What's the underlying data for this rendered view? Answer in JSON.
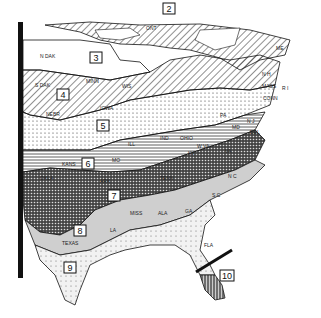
{
  "map": {
    "type": "hardiness-zone-map",
    "region": "Eastern United States",
    "zones": [
      {
        "id": "2",
        "label": "2",
        "pattern": "diagonal-hatch"
      },
      {
        "id": "3",
        "label": "3",
        "pattern": "white"
      },
      {
        "id": "4",
        "label": "4",
        "pattern": "diagonal-hatch"
      },
      {
        "id": "5",
        "label": "5",
        "pattern": "dots"
      },
      {
        "id": "6",
        "label": "6",
        "pattern": "horizontal-lines"
      },
      {
        "id": "7",
        "label": "7",
        "pattern": "cross-hatch-dark"
      },
      {
        "id": "8",
        "label": "8",
        "pattern": "light-gray"
      },
      {
        "id": "9",
        "label": "9",
        "pattern": "sparse-dots"
      },
      {
        "id": "10",
        "label": "10",
        "pattern": "vertical-stripes"
      }
    ],
    "states": {
      "ndak": "N DAK",
      "sdak": "S DAK",
      "minn": "MINN",
      "wis": "WIS",
      "nebr": "NEBR",
      "iowa": "IOWA",
      "kans": "KANS",
      "mo": "MO",
      "ill": "ILL",
      "ind": "IND",
      "ohio": "OHIO",
      "ky": "KY",
      "okla": "OKLA",
      "ark": "ARK",
      "tenn": "TENN",
      "texas": "TEXAS",
      "la": "LA",
      "miss": "MISS",
      "ala": "ALA",
      "ga": "GA",
      "fla": "FLA",
      "sc": "S C",
      "nc": "N C",
      "va": "VA",
      "wva": "W VA",
      "pa": "PA",
      "md": "MD",
      "del": "DEL",
      "nj": "N J",
      "conn": "CONN",
      "mass": "MASS",
      "ri": "R I",
      "nh": "N H",
      "me": "ME",
      "ont": "ONT"
    }
  }
}
